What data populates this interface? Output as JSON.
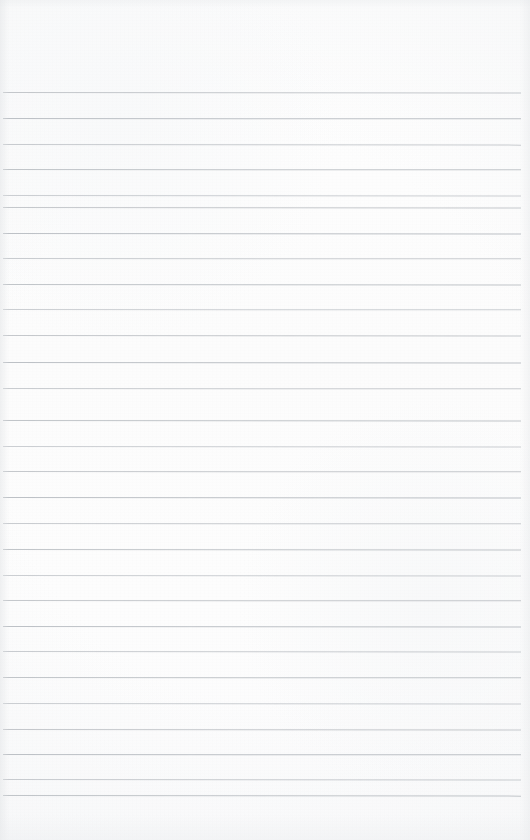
{
  "page": {
    "kind": "lined-notebook-page",
    "width_px": 530,
    "height_px": 840,
    "paper_color": "#fdfdfd",
    "content_text": "",
    "header_note": ""
  },
  "ruling": {
    "line_color": "#b9bdc2",
    "line_thickness_px": 1,
    "line_spacing_px": 25.5,
    "first_line_y_px": 92,
    "last_line_y_px": 795,
    "line_left_x_px": 3,
    "line_right_x_px": 521,
    "line_count": 28,
    "margin_rule_visible": "none",
    "lines": [
      {
        "index": 1,
        "y": 92,
        "left": 3,
        "right": 521,
        "tilt_deg": 0.06
      },
      {
        "index": 2,
        "y": 118,
        "left": 3,
        "right": 521,
        "tilt_deg": 0.04
      },
      {
        "index": 3,
        "y": 144,
        "left": 3,
        "right": 521,
        "tilt_deg": 0.07
      },
      {
        "index": 4,
        "y": 169,
        "left": 3,
        "right": 521,
        "tilt_deg": 0.03
      },
      {
        "index": 5,
        "y": 195,
        "left": 3,
        "right": 521,
        "tilt_deg": 0.05
      },
      {
        "index": 6,
        "y": 207,
        "left": 3,
        "right": 521,
        "tilt_deg": 0.06
      },
      {
        "index": 7,
        "y": 233,
        "left": 3,
        "right": 521,
        "tilt_deg": 0.05
      },
      {
        "index": 8,
        "y": 258,
        "left": 3,
        "right": 521,
        "tilt_deg": 0.04
      },
      {
        "index": 9,
        "y": 284,
        "left": 3,
        "right": 521,
        "tilt_deg": 0.06
      },
      {
        "index": 10,
        "y": 309,
        "left": 3,
        "right": 521,
        "tilt_deg": 0.03
      },
      {
        "index": 11,
        "y": 335,
        "left": 3,
        "right": 521,
        "tilt_deg": 0.05
      },
      {
        "index": 12,
        "y": 362,
        "left": 3,
        "right": 521,
        "tilt_deg": 0.06
      },
      {
        "index": 13,
        "y": 388,
        "left": 3,
        "right": 521,
        "tilt_deg": 0.04
      },
      {
        "index": 14,
        "y": 420,
        "left": 3,
        "right": 521,
        "tilt_deg": 0.05
      },
      {
        "index": 15,
        "y": 446,
        "left": 3,
        "right": 521,
        "tilt_deg": 0.06
      },
      {
        "index": 16,
        "y": 471,
        "left": 3,
        "right": 521,
        "tilt_deg": 0.04
      },
      {
        "index": 17,
        "y": 497,
        "left": 3,
        "right": 521,
        "tilt_deg": 0.05
      },
      {
        "index": 18,
        "y": 523,
        "left": 3,
        "right": 521,
        "tilt_deg": 0.03
      },
      {
        "index": 19,
        "y": 549,
        "left": 3,
        "right": 521,
        "tilt_deg": 0.06
      },
      {
        "index": 20,
        "y": 575,
        "left": 3,
        "right": 521,
        "tilt_deg": 0.05
      },
      {
        "index": 21,
        "y": 600,
        "left": 3,
        "right": 521,
        "tilt_deg": 0.04
      },
      {
        "index": 22,
        "y": 626,
        "left": 3,
        "right": 521,
        "tilt_deg": 0.06
      },
      {
        "index": 23,
        "y": 651,
        "left": 3,
        "right": 521,
        "tilt_deg": 0.05
      },
      {
        "index": 24,
        "y": 677,
        "left": 3,
        "right": 521,
        "tilt_deg": 0.04
      },
      {
        "index": 25,
        "y": 703,
        "left": 3,
        "right": 521,
        "tilt_deg": 0.06
      },
      {
        "index": 26,
        "y": 729,
        "left": 3,
        "right": 521,
        "tilt_deg": 0.05
      },
      {
        "index": 27,
        "y": 754,
        "left": 3,
        "right": 521,
        "tilt_deg": 0.04
      },
      {
        "index": 28,
        "y": 779,
        "left": 3,
        "right": 521,
        "tilt_deg": 0.06
      },
      {
        "index": 29,
        "y": 795,
        "left": 3,
        "right": 521,
        "tilt_deg": 0.07
      }
    ]
  }
}
